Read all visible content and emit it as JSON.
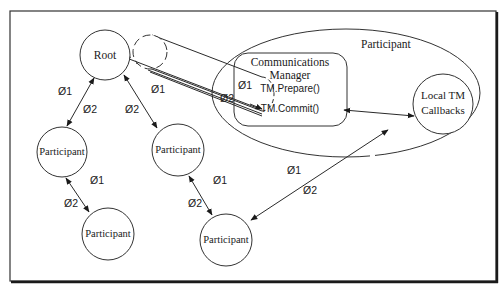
{
  "diagram": {
    "frame_color": "#1a1a1a",
    "nodes": {
      "root": {
        "label": "Root"
      },
      "participant_left": {
        "label": "Participant"
      },
      "participant_center": {
        "label": "Participant"
      },
      "participant_bottom_left": {
        "label": "Participant"
      },
      "participant_bottom_center": {
        "label": "Participant"
      },
      "participant_group": {
        "label": "Participant"
      },
      "comm_manager": {
        "line1": "Communications",
        "line2": "Manager",
        "method1": "TM.Prepare()",
        "method2": "TM.Commit()"
      },
      "local_tm": {
        "line1": "Local TM",
        "line2": "Callbacks"
      }
    },
    "edge_labels": {
      "root_left_phase1": "Ø1",
      "root_left_phase2": "Ø2",
      "root_center_phase2": "Ø2",
      "root_tube_phase1": "Ø1",
      "tube_comm_phase1": "Ø1",
      "tube_comm_phase2": "Ø2",
      "left_bottom_phase1": "Ø1",
      "left_bottom_phase2": "Ø2",
      "center_bottom_phase1": "Ø1",
      "center_bottom_phase2": "Ø2",
      "local_bottom_phase1": "Ø1",
      "local_bottom_phase2": "Ø2"
    }
  }
}
